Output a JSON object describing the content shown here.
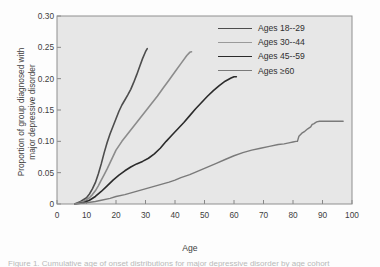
{
  "figure": {
    "caption_sliver": "Figure 1. Cumulative age of onset distributions for major depressive disorder by age cohort"
  },
  "chart_data": {
    "type": "line",
    "title": "",
    "xlabel": "Age",
    "ylabel": "Proportion of group diagnosed with major depressive disorder",
    "ylabel_line1": "Proportion of group diagnosed with",
    "ylabel_line2": "major depressive disorder",
    "xlim": [
      0,
      100
    ],
    "ylim": [
      0,
      0.3
    ],
    "grid": false,
    "legend_position": "top-right",
    "xticks": [
      0,
      10,
      20,
      30,
      40,
      50,
      60,
      70,
      80,
      90,
      100
    ],
    "xtick_labels": [
      "0",
      "10",
      "20",
      "30",
      "40",
      "50",
      "60",
      "70",
      "80",
      "90",
      "100"
    ],
    "yticks": [
      0,
      0.05,
      0.1,
      0.15,
      0.2,
      0.25,
      0.3
    ],
    "ytick_labels": [
      "0",
      "0.05",
      "0.10",
      "0.15",
      "0.20",
      "0.25",
      "0.30"
    ],
    "series": [
      {
        "name": "Ages 18--29",
        "color": "#4d4d4d",
        "width": 1.6,
        "points": [
          [
            6,
            0.0
          ],
          [
            8,
            0.004
          ],
          [
            10,
            0.01
          ],
          [
            11,
            0.016
          ],
          [
            12,
            0.024
          ],
          [
            13,
            0.034
          ],
          [
            14,
            0.048
          ],
          [
            15,
            0.064
          ],
          [
            16,
            0.082
          ],
          [
            17,
            0.098
          ],
          [
            18,
            0.112
          ],
          [
            19,
            0.124
          ],
          [
            20,
            0.136
          ],
          [
            21,
            0.148
          ],
          [
            22,
            0.158
          ],
          [
            23,
            0.166
          ],
          [
            24,
            0.174
          ],
          [
            25,
            0.183
          ],
          [
            26,
            0.194
          ],
          [
            27,
            0.206
          ],
          [
            28,
            0.219
          ],
          [
            29,
            0.232
          ],
          [
            30,
            0.243
          ],
          [
            30.6,
            0.248
          ]
        ]
      },
      {
        "name": "Ages 30--44",
        "color": "#8c8c8c",
        "width": 1.6,
        "points": [
          [
            6,
            0.0
          ],
          [
            9,
            0.004
          ],
          [
            11,
            0.01
          ],
          [
            12,
            0.015
          ],
          [
            13,
            0.021
          ],
          [
            14,
            0.029
          ],
          [
            15,
            0.038
          ],
          [
            16,
            0.047
          ],
          [
            17,
            0.056
          ],
          [
            18,
            0.066
          ],
          [
            19,
            0.076
          ],
          [
            20,
            0.086
          ],
          [
            22,
            0.1
          ],
          [
            24,
            0.112
          ],
          [
            26,
            0.124
          ],
          [
            28,
            0.136
          ],
          [
            30,
            0.148
          ],
          [
            32,
            0.16
          ],
          [
            34,
            0.172
          ],
          [
            36,
            0.185
          ],
          [
            38,
            0.198
          ],
          [
            40,
            0.211
          ],
          [
            42,
            0.224
          ],
          [
            44,
            0.237
          ],
          [
            45,
            0.242
          ],
          [
            45.6,
            0.243
          ]
        ]
      },
      {
        "name": "Ages 45--59",
        "color": "#2b2b2b",
        "width": 1.6,
        "points": [
          [
            6,
            0.0
          ],
          [
            9,
            0.002
          ],
          [
            11,
            0.006
          ],
          [
            13,
            0.012
          ],
          [
            15,
            0.02
          ],
          [
            17,
            0.029
          ],
          [
            19,
            0.038
          ],
          [
            21,
            0.046
          ],
          [
            23,
            0.053
          ],
          [
            25,
            0.059
          ],
          [
            27,
            0.064
          ],
          [
            29,
            0.068
          ],
          [
            31,
            0.073
          ],
          [
            33,
            0.08
          ],
          [
            35,
            0.089
          ],
          [
            37,
            0.1
          ],
          [
            39,
            0.11
          ],
          [
            41,
            0.12
          ],
          [
            43,
            0.13
          ],
          [
            45,
            0.141
          ],
          [
            47,
            0.152
          ],
          [
            49,
            0.162
          ],
          [
            51,
            0.172
          ],
          [
            53,
            0.181
          ],
          [
            55,
            0.189
          ],
          [
            57,
            0.196
          ],
          [
            59,
            0.201
          ],
          [
            60,
            0.203
          ],
          [
            60.8,
            0.203
          ]
        ]
      },
      {
        "name": "Ages ≥60",
        "color": "#7a7a7a",
        "width": 1.4,
        "points": [
          [
            6,
            0.0
          ],
          [
            10,
            0.002
          ],
          [
            13,
            0.004
          ],
          [
            15,
            0.006
          ],
          [
            18,
            0.009
          ],
          [
            20,
            0.012
          ],
          [
            23,
            0.015
          ],
          [
            26,
            0.019
          ],
          [
            29,
            0.023
          ],
          [
            32,
            0.027
          ],
          [
            35,
            0.031
          ],
          [
            38,
            0.035
          ],
          [
            40,
            0.038
          ],
          [
            42,
            0.042
          ],
          [
            45,
            0.047
          ],
          [
            48,
            0.053
          ],
          [
            51,
            0.059
          ],
          [
            54,
            0.065
          ],
          [
            57,
            0.071
          ],
          [
            60,
            0.077
          ],
          [
            63,
            0.082
          ],
          [
            66,
            0.086
          ],
          [
            69,
            0.089
          ],
          [
            72,
            0.092
          ],
          [
            75,
            0.095
          ],
          [
            77,
            0.096
          ],
          [
            79,
            0.098
          ],
          [
            80,
            0.099
          ],
          [
            81,
            0.1
          ],
          [
            81.5,
            0.1
          ],
          [
            82,
            0.108
          ],
          [
            83,
            0.113
          ],
          [
            84,
            0.116
          ],
          [
            85,
            0.12
          ],
          [
            86,
            0.123
          ],
          [
            86.5,
            0.127
          ],
          [
            87,
            0.128
          ],
          [
            88,
            0.131
          ],
          [
            89,
            0.132
          ],
          [
            92,
            0.132
          ],
          [
            95,
            0.132
          ],
          [
            97,
            0.132
          ]
        ]
      }
    ],
    "legend": [
      {
        "label": "Ages 18--29",
        "color": "#4d4d4d",
        "width": 1.9
      },
      {
        "label": "Ages 30--44",
        "color": "#9a9a9a",
        "width": 1.4
      },
      {
        "label": "Ages 45--59",
        "color": "#2b2b2b",
        "width": 1.9
      },
      {
        "label": "Ages ≥60",
        "color": "#7a7a7a",
        "width": 1.3
      }
    ],
    "axes": {
      "plot_bg": "#e7e7e7",
      "frame_color": "#8f8f8f",
      "tick_color": "#6f6f6f"
    }
  }
}
